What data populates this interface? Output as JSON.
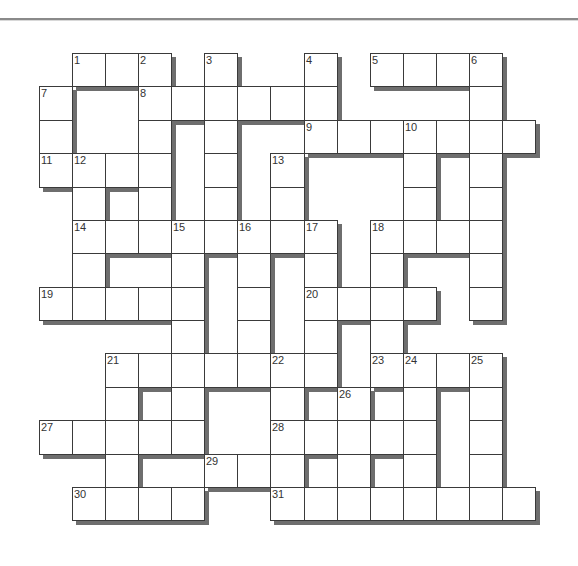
{
  "puzzle": {
    "cols": 15,
    "rows": 14,
    "origin_x": 39,
    "origin_y": 53,
    "cell_w": 33.07,
    "cell_h": 33.38,
    "shadow_color": "#6e6e6e",
    "border_color": "#3a3a3a",
    "cells": [
      {
        "r": 0,
        "c": 1,
        "n": "1"
      },
      {
        "r": 0,
        "c": 2
      },
      {
        "r": 0,
        "c": 3,
        "n": "2"
      },
      {
        "r": 0,
        "c": 5,
        "n": "3"
      },
      {
        "r": 0,
        "c": 8,
        "n": "4"
      },
      {
        "r": 0,
        "c": 10,
        "n": "5"
      },
      {
        "r": 0,
        "c": 11
      },
      {
        "r": 0,
        "c": 12
      },
      {
        "r": 0,
        "c": 13,
        "n": "6"
      },
      {
        "r": 1,
        "c": 0,
        "n": "7"
      },
      {
        "r": 1,
        "c": 3,
        "n": "8"
      },
      {
        "r": 1,
        "c": 4
      },
      {
        "r": 1,
        "c": 5
      },
      {
        "r": 1,
        "c": 6
      },
      {
        "r": 1,
        "c": 7
      },
      {
        "r": 1,
        "c": 8
      },
      {
        "r": 1,
        "c": 13
      },
      {
        "r": 2,
        "c": 0
      },
      {
        "r": 2,
        "c": 3
      },
      {
        "r": 2,
        "c": 5
      },
      {
        "r": 2,
        "c": 8,
        "n": "9"
      },
      {
        "r": 2,
        "c": 9
      },
      {
        "r": 2,
        "c": 10
      },
      {
        "r": 2,
        "c": 11,
        "n": "10"
      },
      {
        "r": 2,
        "c": 12
      },
      {
        "r": 2,
        "c": 13
      },
      {
        "r": 2,
        "c": 14
      },
      {
        "r": 3,
        "c": 0,
        "n": "11"
      },
      {
        "r": 3,
        "c": 1,
        "n": "12"
      },
      {
        "r": 3,
        "c": 2
      },
      {
        "r": 3,
        "c": 3
      },
      {
        "r": 3,
        "c": 5
      },
      {
        "r": 3,
        "c": 7,
        "n": "13"
      },
      {
        "r": 3,
        "c": 11
      },
      {
        "r": 3,
        "c": 13
      },
      {
        "r": 4,
        "c": 1
      },
      {
        "r": 4,
        "c": 3
      },
      {
        "r": 4,
        "c": 5
      },
      {
        "r": 4,
        "c": 7
      },
      {
        "r": 4,
        "c": 11
      },
      {
        "r": 4,
        "c": 13
      },
      {
        "r": 5,
        "c": 1,
        "n": "14"
      },
      {
        "r": 5,
        "c": 2
      },
      {
        "r": 5,
        "c": 3
      },
      {
        "r": 5,
        "c": 4,
        "n": "15"
      },
      {
        "r": 5,
        "c": 5
      },
      {
        "r": 5,
        "c": 6,
        "n": "16"
      },
      {
        "r": 5,
        "c": 7
      },
      {
        "r": 5,
        "c": 8,
        "n": "17"
      },
      {
        "r": 5,
        "c": 10,
        "n": "18"
      },
      {
        "r": 5,
        "c": 11
      },
      {
        "r": 5,
        "c": 12
      },
      {
        "r": 5,
        "c": 13
      },
      {
        "r": 6,
        "c": 1
      },
      {
        "r": 6,
        "c": 4
      },
      {
        "r": 6,
        "c": 6
      },
      {
        "r": 6,
        "c": 8
      },
      {
        "r": 6,
        "c": 10
      },
      {
        "r": 6,
        "c": 13
      },
      {
        "r": 7,
        "c": 0,
        "n": "19"
      },
      {
        "r": 7,
        "c": 1
      },
      {
        "r": 7,
        "c": 2
      },
      {
        "r": 7,
        "c": 3
      },
      {
        "r": 7,
        "c": 4
      },
      {
        "r": 7,
        "c": 6
      },
      {
        "r": 7,
        "c": 8,
        "n": "20"
      },
      {
        "r": 7,
        "c": 9
      },
      {
        "r": 7,
        "c": 10
      },
      {
        "r": 7,
        "c": 11
      },
      {
        "r": 7,
        "c": 13
      },
      {
        "r": 8,
        "c": 4
      },
      {
        "r": 8,
        "c": 6
      },
      {
        "r": 8,
        "c": 8
      },
      {
        "r": 8,
        "c": 10
      },
      {
        "r": 9,
        "c": 2,
        "n": "21"
      },
      {
        "r": 9,
        "c": 3
      },
      {
        "r": 9,
        "c": 4
      },
      {
        "r": 9,
        "c": 5
      },
      {
        "r": 9,
        "c": 6
      },
      {
        "r": 9,
        "c": 7,
        "n": "22"
      },
      {
        "r": 9,
        "c": 8
      },
      {
        "r": 9,
        "c": 10,
        "n": "23"
      },
      {
        "r": 9,
        "c": 11,
        "n": "24"
      },
      {
        "r": 9,
        "c": 12
      },
      {
        "r": 9,
        "c": 13,
        "n": "25"
      },
      {
        "r": 10,
        "c": 2
      },
      {
        "r": 10,
        "c": 4
      },
      {
        "r": 10,
        "c": 7
      },
      {
        "r": 10,
        "c": 9,
        "n": "26"
      },
      {
        "r": 10,
        "c": 11
      },
      {
        "r": 10,
        "c": 13
      },
      {
        "r": 11,
        "c": 0,
        "n": "27"
      },
      {
        "r": 11,
        "c": 1
      },
      {
        "r": 11,
        "c": 2
      },
      {
        "r": 11,
        "c": 3
      },
      {
        "r": 11,
        "c": 4
      },
      {
        "r": 11,
        "c": 7,
        "n": "28"
      },
      {
        "r": 11,
        "c": 8
      },
      {
        "r": 11,
        "c": 9
      },
      {
        "r": 11,
        "c": 10
      },
      {
        "r": 11,
        "c": 11
      },
      {
        "r": 11,
        "c": 13
      },
      {
        "r": 12,
        "c": 2
      },
      {
        "r": 12,
        "c": 5,
        "n": "29"
      },
      {
        "r": 12,
        "c": 6
      },
      {
        "r": 12,
        "c": 7
      },
      {
        "r": 12,
        "c": 9
      },
      {
        "r": 12,
        "c": 11
      },
      {
        "r": 12,
        "c": 13
      },
      {
        "r": 13,
        "c": 1,
        "n": "30"
      },
      {
        "r": 13,
        "c": 2
      },
      {
        "r": 13,
        "c": 3
      },
      {
        "r": 13,
        "c": 4
      },
      {
        "r": 13,
        "c": 7,
        "n": "31"
      },
      {
        "r": 13,
        "c": 8
      },
      {
        "r": 13,
        "c": 9
      },
      {
        "r": 13,
        "c": 10
      },
      {
        "r": 13,
        "c": 11
      },
      {
        "r": 13,
        "c": 12
      },
      {
        "r": 13,
        "c": 13
      },
      {
        "r": 13,
        "c": 14
      }
    ]
  }
}
